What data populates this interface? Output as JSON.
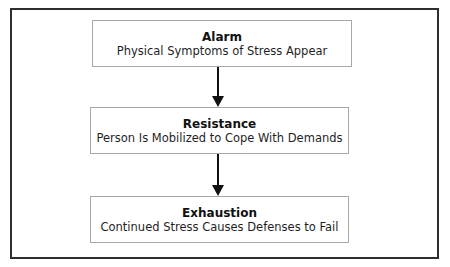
{
  "diagram": {
    "type": "flowchart",
    "direction": "top-to-bottom",
    "stages": [
      {
        "title": "Alarm",
        "description": "Physical Symptoms of Stress Appear"
      },
      {
        "title": "Resistance",
        "description": "Person Is Mobilized to Cope With Demands"
      },
      {
        "title": "Exhaustion",
        "description": "Continued Stress Causes Defenses to Fail"
      }
    ],
    "connections": [
      {
        "from": "Alarm",
        "to": "Resistance"
      },
      {
        "from": "Resistance",
        "to": "Exhaustion"
      }
    ],
    "colors": {
      "frame_border": "#2e2e2e",
      "box_border": "#a8a8a8",
      "arrow": "#111111",
      "background": "#ffffff"
    }
  }
}
